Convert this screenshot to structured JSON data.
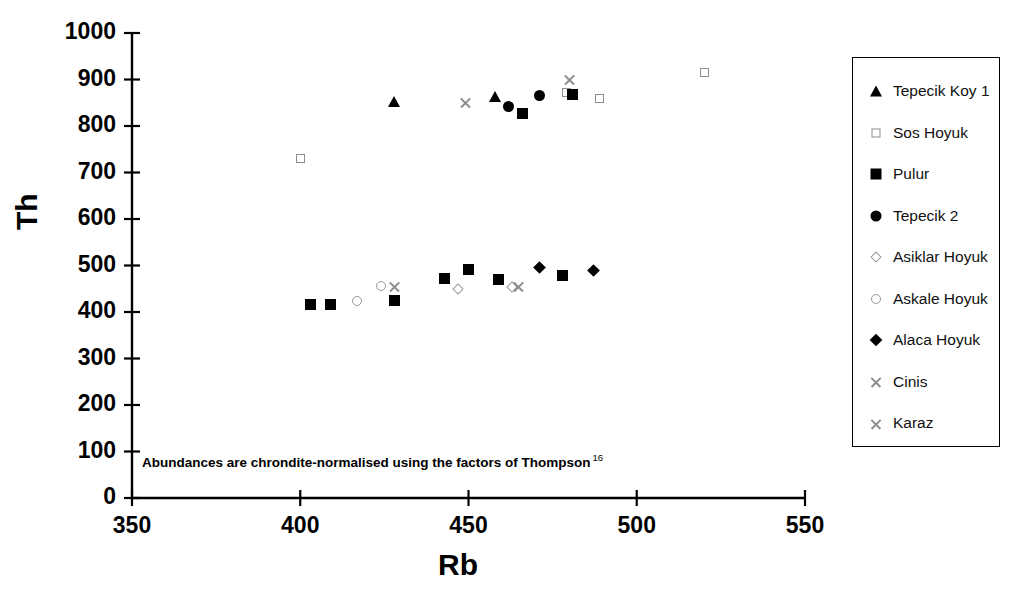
{
  "chart_data": {
    "type": "scatter",
    "title": "",
    "xlabel": "Rb",
    "ylabel": "Th",
    "xlim": [
      350,
      550
    ],
    "ylim": [
      0,
      1000
    ],
    "xticks": [
      350,
      400,
      450,
      500,
      550
    ],
    "yticks": [
      0,
      100,
      200,
      300,
      400,
      500,
      600,
      700,
      800,
      900,
      1000
    ],
    "grid": false,
    "legend_position": "right",
    "annotation": "Abundances are chrondite-normalised using the factors of Thompson",
    "annotation_superscript": "16",
    "series": [
      {
        "name": "Tepecik Koy 1",
        "marker": "filled-triangle",
        "color": "#000000",
        "points": [
          {
            "x": 428,
            "y": 853
          },
          {
            "x": 458,
            "y": 864
          }
        ]
      },
      {
        "name": "Sos Hoyuk",
        "marker": "open-square",
        "color": "#8d8d8d",
        "points": [
          {
            "x": 400,
            "y": 731
          },
          {
            "x": 479,
            "y": 872
          },
          {
            "x": 489,
            "y": 860
          },
          {
            "x": 520,
            "y": 914
          }
        ]
      },
      {
        "name": "Pulur",
        "marker": "filled-square",
        "color": "#000000",
        "points": [
          {
            "x": 403,
            "y": 417
          },
          {
            "x": 409,
            "y": 417
          },
          {
            "x": 428,
            "y": 424
          },
          {
            "x": 443,
            "y": 471
          },
          {
            "x": 450,
            "y": 491
          },
          {
            "x": 459,
            "y": 470
          },
          {
            "x": 466,
            "y": 826
          },
          {
            "x": 481,
            "y": 867
          },
          {
            "x": 478,
            "y": 478
          }
        ]
      },
      {
        "name": "Tepecik 2",
        "marker": "filled-circle",
        "color": "#000000",
        "points": [
          {
            "x": 462,
            "y": 841
          },
          {
            "x": 471,
            "y": 866
          }
        ]
      },
      {
        "name": "Asiklar Hoyuk",
        "marker": "open-diamond",
        "color": "#9a9a9a",
        "points": [
          {
            "x": 447,
            "y": 449
          },
          {
            "x": 463,
            "y": 453
          }
        ]
      },
      {
        "name": "Askale Hoyuk",
        "marker": "open-circle",
        "color": "#9a9a9a",
        "points": [
          {
            "x": 417,
            "y": 424
          },
          {
            "x": 424,
            "y": 455
          }
        ]
      },
      {
        "name": "Alaca Hoyuk",
        "marker": "filled-diamond",
        "color": "#000000",
        "points": [
          {
            "x": 471,
            "y": 495
          },
          {
            "x": 487,
            "y": 489
          }
        ]
      },
      {
        "name": "Cinis",
        "marker": "cross",
        "color": "#8d8d8d",
        "points": [
          {
            "x": 428,
            "y": 455
          },
          {
            "x": 465,
            "y": 455
          }
        ]
      },
      {
        "name": "Karaz",
        "marker": "cross",
        "color": "#8d8d8d",
        "points": [
          {
            "x": 449,
            "y": 852
          },
          {
            "x": 480,
            "y": 901
          }
        ]
      }
    ]
  },
  "legend": {
    "items": [
      {
        "label": "Tepecik Koy 1",
        "marker": "filled-triangle"
      },
      {
        "label": "Sos Hoyuk",
        "marker": "open-square"
      },
      {
        "label": "Pulur",
        "marker": "filled-square"
      },
      {
        "label": "Tepecik 2",
        "marker": "filled-circle"
      },
      {
        "label": "Asiklar Hoyuk",
        "marker": "open-diamond"
      },
      {
        "label": "Askale Hoyuk",
        "marker": "open-circle"
      },
      {
        "label": "Alaca Hoyuk",
        "marker": "filled-diamond"
      },
      {
        "label": "Cinis",
        "marker": "cross"
      },
      {
        "label": "Karaz",
        "marker": "cross"
      }
    ]
  }
}
